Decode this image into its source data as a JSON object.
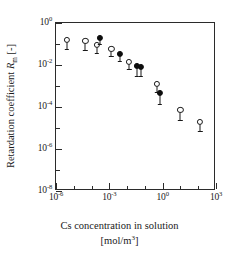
{
  "chart_data": {
    "type": "scatter",
    "title": "",
    "xlabel": "Cs concentration in solution [mol/m3]",
    "xlabel_line1": "Cs concentration in solution",
    "xlabel_line2_prefix": "[mol/m",
    "xlabel_line2_sup": "3",
    "xlabel_line2_suffix": "]",
    "ylabel": "Retardation coefficient Rm [-]",
    "ylabel_prefix": "Retardation coefficient ",
    "ylabel_symbol": "R",
    "ylabel_sub": "m",
    "ylabel_suffix": " [-]",
    "xscale": "log",
    "yscale": "log",
    "xlim": [
      1e-06,
      1000
    ],
    "ylim": [
      1e-08,
      1
    ],
    "grid": false,
    "legend": "none",
    "x_ticks": [
      {
        "value": 1e-06,
        "label_base": "10",
        "label_exp": "-6"
      },
      {
        "value": 0.001,
        "label_base": "10",
        "label_exp": "-3"
      },
      {
        "value": 1,
        "label_base": "10",
        "label_exp": "0"
      },
      {
        "value": 1000,
        "label_base": "10",
        "label_exp": "3"
      }
    ],
    "y_ticks": [
      {
        "value": 1,
        "label_base": "10",
        "label_exp": "0"
      },
      {
        "value": 0.01,
        "label_base": "10",
        "label_exp": "-2"
      },
      {
        "value": 0.0001,
        "label_base": "10",
        "label_exp": "-4"
      },
      {
        "value": 1e-06,
        "label_base": "10",
        "label_exp": "-6"
      },
      {
        "value": 1e-08,
        "label_base": "10",
        "label_exp": "-8"
      }
    ],
    "x_minor_ticks": [
      1e-05,
      0.0001,
      0.01,
      0.1,
      10,
      100
    ],
    "y_minor_ticks": [
      0.1,
      0.001,
      1e-05,
      1e-07
    ],
    "series": [
      {
        "name": "open circles",
        "marker": "open-circle",
        "color": "#181818",
        "points": [
          {
            "x": 4e-06,
            "y": 0.16,
            "yerr_lo": 0.45,
            "yerr_hi": 0.0
          },
          {
            "x": 4.5e-05,
            "y": 0.14,
            "yerr_lo": 0.45,
            "yerr_hi": 0.0
          },
          {
            "x": 0.0002,
            "y": 0.09,
            "yerr_lo": 0.4,
            "yerr_hi": 0.0
          },
          {
            "x": 0.0013,
            "y": 0.06,
            "yerr_lo": 0.35,
            "yerr_hi": 0.0
          },
          {
            "x": 0.013,
            "y": 0.014,
            "yerr_lo": 0.35,
            "yerr_hi": 0.0
          },
          {
            "x": 0.45,
            "y": 0.0013,
            "yerr_lo": 0.4,
            "yerr_hi": 0.0
          },
          {
            "x": 10.0,
            "y": 7e-05,
            "yerr_lo": 0.45,
            "yerr_hi": 0.0
          },
          {
            "x": 130.0,
            "y": 2e-05,
            "yerr_lo": 0.45,
            "yerr_hi": 0.0
          }
        ]
      },
      {
        "name": "filled circles",
        "marker": "filled-circle",
        "color": "#0d0d0d",
        "points": [
          {
            "x": 0.0003,
            "y": 0.2,
            "yerr_lo": 0.3,
            "yerr_hi": 0.0
          },
          {
            "x": 0.004,
            "y": 0.035,
            "yerr_lo": 0.35,
            "yerr_hi": 0.0
          },
          {
            "x": 0.035,
            "y": 0.009,
            "yerr_lo": 0.5,
            "yerr_hi": 0.0
          },
          {
            "x": 0.06,
            "y": 0.008,
            "yerr_lo": 0.45,
            "yerr_hi": 0.0
          },
          {
            "x": 0.7,
            "y": 0.00045,
            "yerr_lo": 0.5,
            "yerr_hi": 0.0
          }
        ]
      }
    ]
  }
}
